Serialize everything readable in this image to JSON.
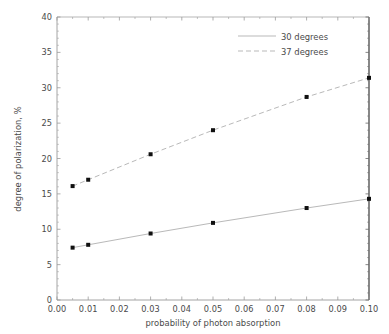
{
  "chart_data": {
    "type": "line",
    "title": "",
    "xlabel": "probability of photon absorption",
    "ylabel": "degree of polarization, %",
    "xlim": [
      0.0,
      0.1
    ],
    "ylim": [
      0,
      40
    ],
    "xticks": [
      "0.00",
      "0.01",
      "0.02",
      "0.03",
      "0.04",
      "0.05",
      "0.06",
      "0.07",
      "0.08",
      "0.09",
      "0.10"
    ],
    "xtick_values": [
      0.0,
      0.01,
      0.02,
      0.03,
      0.04,
      0.05,
      0.06,
      0.07,
      0.08,
      0.09,
      0.1
    ],
    "yticks": [
      "0",
      "5",
      "10",
      "15",
      "20",
      "25",
      "30",
      "35",
      "40"
    ],
    "ytick_values": [
      0,
      5,
      10,
      15,
      20,
      25,
      30,
      35,
      40
    ],
    "grid": false,
    "legend_position": "upper right",
    "marker": "square",
    "marker_color": "#101010",
    "x": [
      0.005,
      0.01,
      0.03,
      0.05,
      0.08,
      0.1
    ],
    "series": [
      {
        "name": "30 degrees",
        "values": [
          7.4,
          7.8,
          9.4,
          10.9,
          13.0,
          14.3
        ],
        "linestyle": "solid",
        "color": "#b9b9b9"
      },
      {
        "name": "37 degrees",
        "values": [
          16.1,
          17.0,
          20.6,
          24.0,
          28.7,
          31.4
        ],
        "linestyle": "dashed",
        "color": "#b9b9b9"
      }
    ]
  },
  "legend": {
    "entries": [
      {
        "label": "30 degrees"
      },
      {
        "label": "37 degrees"
      }
    ]
  },
  "colors": {
    "background": "#ffffff",
    "axis": "#9a9a9a",
    "axis_dark": "#6a6a6a",
    "text": "#4a4a4a",
    "marker": "#101010",
    "line": "#b9b9b9"
  }
}
